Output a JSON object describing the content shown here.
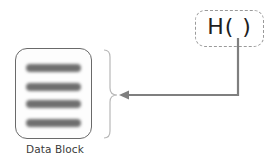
{
  "diagram": {
    "data_block": {
      "label": "Data Block",
      "bar_count": 4,
      "bar_color": "#6f6f6f",
      "border_color": "#6a6a6a"
    },
    "hash_function": {
      "label": "H(  )",
      "border_style": "dashed",
      "border_color": "#9a9a9a"
    },
    "connector": {
      "from": "hash_function",
      "to": "data_block",
      "style": "elbow-arrow",
      "color": "#7f7f7f"
    },
    "brace": {
      "side": "right-of-data-block",
      "color": "#b0b0b0"
    }
  }
}
